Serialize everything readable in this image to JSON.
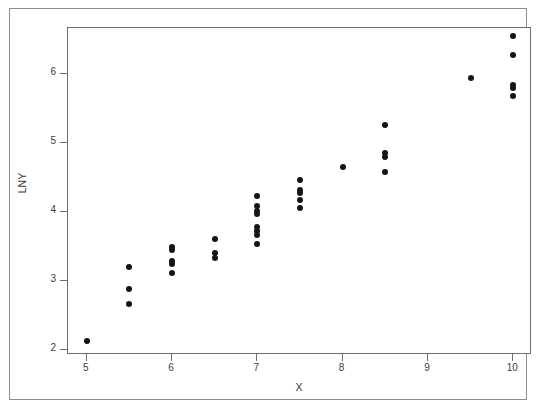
{
  "chart_data": {
    "type": "scatter",
    "title": "",
    "xlabel": "X",
    "ylabel": "LNY",
    "xlim": [
      4.78,
      10.22
    ],
    "ylim": [
      1.93,
      6.66
    ],
    "grid": false,
    "legend": "none",
    "xticks": [
      5,
      6,
      7,
      8,
      9,
      10
    ],
    "xtick_labels": [
      "5",
      "6",
      "7",
      "8",
      "9",
      "10"
    ],
    "yticks": [
      2,
      3,
      4,
      5,
      6
    ],
    "ytick_labels": [
      "2",
      "3",
      "4",
      "5",
      "6"
    ],
    "marker": "filled-circle",
    "marker_color": "#151515",
    "marker_size_px": 6,
    "x": [
      5.0,
      5.5,
      5.5,
      5.5,
      6.0,
      6.0,
      6.0,
      6.0,
      6.0,
      6.5,
      6.5,
      6.5,
      7.0,
      7.0,
      7.0,
      7.0,
      7.0,
      7.0,
      7.0,
      7.0,
      7.5,
      7.5,
      7.5,
      7.5,
      7.5,
      8.0,
      8.5,
      8.5,
      8.5,
      8.5,
      9.5,
      10.0,
      10.0,
      10.0,
      10.0,
      10.0
    ],
    "y": [
      2.13,
      3.2,
      2.89,
      2.67,
      3.49,
      3.45,
      3.29,
      3.25,
      3.12,
      3.61,
      3.41,
      3.33,
      4.23,
      4.08,
      4.01,
      3.97,
      3.78,
      3.73,
      3.67,
      3.54,
      4.46,
      4.32,
      4.27,
      4.17,
      4.05,
      4.65,
      5.25,
      4.85,
      4.8,
      4.58,
      5.93,
      6.55,
      6.27,
      5.84,
      5.79,
      5.67
    ],
    "points": [
      {
        "x": 5.0,
        "y": 2.13
      },
      {
        "x": 5.5,
        "y": 3.2
      },
      {
        "x": 5.5,
        "y": 2.89
      },
      {
        "x": 5.5,
        "y": 2.67
      },
      {
        "x": 6.0,
        "y": 3.49
      },
      {
        "x": 6.0,
        "y": 3.45
      },
      {
        "x": 6.0,
        "y": 3.29
      },
      {
        "x": 6.0,
        "y": 3.25
      },
      {
        "x": 6.0,
        "y": 3.12
      },
      {
        "x": 6.5,
        "y": 3.61
      },
      {
        "x": 6.5,
        "y": 3.41
      },
      {
        "x": 6.5,
        "y": 3.33
      },
      {
        "x": 7.0,
        "y": 4.23
      },
      {
        "x": 7.0,
        "y": 4.08
      },
      {
        "x": 7.0,
        "y": 4.01
      },
      {
        "x": 7.0,
        "y": 3.97
      },
      {
        "x": 7.0,
        "y": 3.78
      },
      {
        "x": 7.0,
        "y": 3.73
      },
      {
        "x": 7.0,
        "y": 3.67
      },
      {
        "x": 7.0,
        "y": 3.54
      },
      {
        "x": 7.5,
        "y": 4.46
      },
      {
        "x": 7.5,
        "y": 4.32
      },
      {
        "x": 7.5,
        "y": 4.27
      },
      {
        "x": 7.5,
        "y": 4.17
      },
      {
        "x": 7.5,
        "y": 4.05
      },
      {
        "x": 8.0,
        "y": 4.65
      },
      {
        "x": 8.5,
        "y": 5.25
      },
      {
        "x": 8.5,
        "y": 4.85
      },
      {
        "x": 8.5,
        "y": 4.8
      },
      {
        "x": 8.5,
        "y": 4.58
      },
      {
        "x": 9.5,
        "y": 5.93
      },
      {
        "x": 10.0,
        "y": 6.55
      },
      {
        "x": 10.0,
        "y": 6.27
      },
      {
        "x": 10.0,
        "y": 5.84
      },
      {
        "x": 10.0,
        "y": 5.79
      },
      {
        "x": 10.0,
        "y": 5.67
      }
    ]
  },
  "colors": {
    "marker": "#151515",
    "axis": "#6e6e6e",
    "frame": "#8b8b8b",
    "text": "#3a3a3a",
    "background": "#ffffff"
  }
}
